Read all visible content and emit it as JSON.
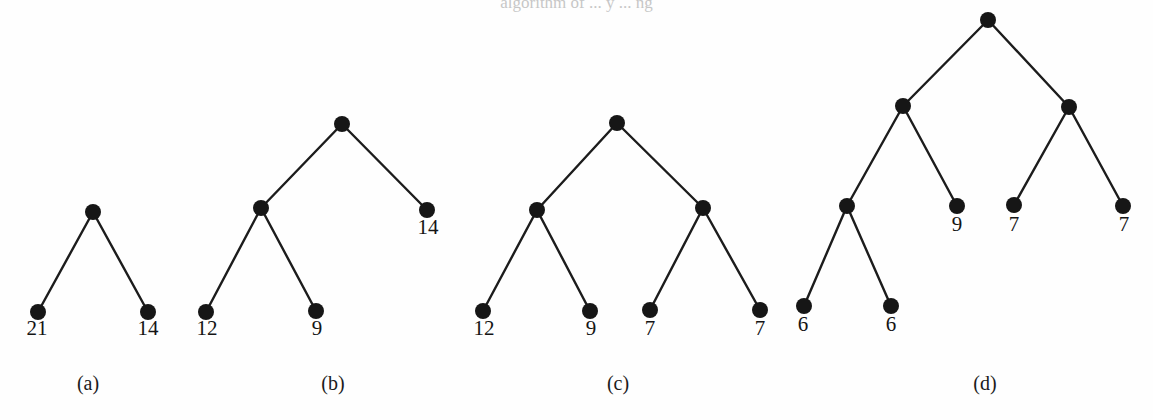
{
  "figure": {
    "background_color": "#fefefe",
    "ink_color": "#161616",
    "clipped_header_text": "algorithm         of  ...  y ... ng",
    "width": 1153,
    "height": 420
  },
  "chart_data": {
    "type": "diagram",
    "diagram_kind": "huffman-binary-tree-sequence",
    "title": "",
    "node_radius": 8,
    "subfigures": [
      {
        "id": "a",
        "caption": "(a)",
        "caption_pos": {
          "x": 88,
          "y": 390
        },
        "nodes": [
          {
            "id": "a-root",
            "x": 93,
            "y": 212,
            "label": "",
            "type": "internal"
          },
          {
            "id": "a-l",
            "x": 38,
            "y": 312,
            "label": "21",
            "type": "leaf",
            "label_pos": {
              "x": 37,
              "y": 335
            }
          },
          {
            "id": "a-r",
            "x": 148,
            "y": 312,
            "label": "14",
            "type": "leaf",
            "label_pos": {
              "x": 148,
              "y": 335
            }
          }
        ],
        "edges": [
          [
            "a-root",
            "a-l"
          ],
          [
            "a-root",
            "a-r"
          ]
        ]
      },
      {
        "id": "b",
        "caption": "(b)",
        "caption_pos": {
          "x": 333,
          "y": 390
        },
        "nodes": [
          {
            "id": "b-root",
            "x": 342,
            "y": 124,
            "label": "",
            "type": "internal"
          },
          {
            "id": "b-i1",
            "x": 261,
            "y": 208,
            "label": "",
            "type": "internal"
          },
          {
            "id": "b-r",
            "x": 427,
            "y": 210,
            "label": "14",
            "type": "leaf",
            "label_pos": {
              "x": 428,
              "y": 234
            }
          },
          {
            "id": "b-l1",
            "x": 206,
            "y": 312,
            "label": "12",
            "type": "leaf",
            "label_pos": {
              "x": 207,
              "y": 335
            }
          },
          {
            "id": "b-l2",
            "x": 316,
            "y": 311,
            "label": "9",
            "type": "leaf",
            "label_pos": {
              "x": 317,
              "y": 335
            }
          }
        ],
        "edges": [
          [
            "b-root",
            "b-i1"
          ],
          [
            "b-root",
            "b-r"
          ],
          [
            "b-i1",
            "b-l1"
          ],
          [
            "b-i1",
            "b-l2"
          ]
        ]
      },
      {
        "id": "c",
        "caption": "(c)",
        "caption_pos": {
          "x": 618,
          "y": 390
        },
        "nodes": [
          {
            "id": "c-root",
            "x": 617,
            "y": 123,
            "label": "",
            "type": "internal"
          },
          {
            "id": "c-i1",
            "x": 537,
            "y": 210,
            "label": "",
            "type": "internal"
          },
          {
            "id": "c-i2",
            "x": 703,
            "y": 208,
            "label": "",
            "type": "internal"
          },
          {
            "id": "c-l1",
            "x": 483,
            "y": 311,
            "label": "12",
            "type": "leaf",
            "label_pos": {
              "x": 484,
              "y": 335
            }
          },
          {
            "id": "c-l2",
            "x": 590,
            "y": 311,
            "label": "9",
            "type": "leaf",
            "label_pos": {
              "x": 591,
              "y": 335
            }
          },
          {
            "id": "c-l3",
            "x": 650,
            "y": 310,
            "label": "7",
            "type": "leaf",
            "label_pos": {
              "x": 650,
              "y": 335
            }
          },
          {
            "id": "c-l4",
            "x": 760,
            "y": 310,
            "label": "7",
            "type": "leaf",
            "label_pos": {
              "x": 760,
              "y": 335
            }
          }
        ],
        "edges": [
          [
            "c-root",
            "c-i1"
          ],
          [
            "c-root",
            "c-i2"
          ],
          [
            "c-i1",
            "c-l1"
          ],
          [
            "c-i1",
            "c-l2"
          ],
          [
            "c-i2",
            "c-l3"
          ],
          [
            "c-i2",
            "c-l4"
          ]
        ]
      },
      {
        "id": "d",
        "caption": "(d)",
        "caption_pos": {
          "x": 985,
          "y": 390
        },
        "nodes": [
          {
            "id": "d-root",
            "x": 988,
            "y": 20,
            "label": "",
            "type": "internal"
          },
          {
            "id": "d-i1",
            "x": 903,
            "y": 106,
            "label": "",
            "type": "internal"
          },
          {
            "id": "d-i2",
            "x": 1069,
            "y": 107,
            "label": "",
            "type": "internal"
          },
          {
            "id": "d-i3",
            "x": 847,
            "y": 206,
            "label": "",
            "type": "internal"
          },
          {
            "id": "d-l9",
            "x": 957,
            "y": 206,
            "label": "9",
            "type": "leaf",
            "label_pos": {
              "x": 957,
              "y": 231
            }
          },
          {
            "id": "d-l7a",
            "x": 1014,
            "y": 205,
            "label": "7",
            "type": "leaf",
            "label_pos": {
              "x": 1014,
              "y": 231
            }
          },
          {
            "id": "d-l7b",
            "x": 1123,
            "y": 206,
            "label": "7",
            "type": "leaf",
            "label_pos": {
              "x": 1124,
              "y": 231
            }
          },
          {
            "id": "d-l6a",
            "x": 804,
            "y": 306,
            "label": "6",
            "type": "leaf",
            "label_pos": {
              "x": 803,
              "y": 331
            }
          },
          {
            "id": "d-l6b",
            "x": 891,
            "y": 306,
            "label": "6",
            "type": "leaf",
            "label_pos": {
              "x": 891,
              "y": 331
            }
          }
        ],
        "edges": [
          [
            "d-root",
            "d-i1"
          ],
          [
            "d-root",
            "d-i2"
          ],
          [
            "d-i1",
            "d-i3"
          ],
          [
            "d-i1",
            "d-l9"
          ],
          [
            "d-i2",
            "d-l7a"
          ],
          [
            "d-i2",
            "d-l7b"
          ],
          [
            "d-i3",
            "d-l6a"
          ],
          [
            "d-i3",
            "d-l6b"
          ]
        ]
      }
    ]
  }
}
